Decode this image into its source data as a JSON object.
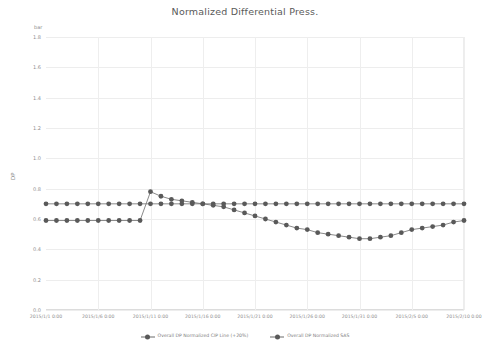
{
  "chart_data": {
    "type": "line",
    "title": "Normalized Differential Press.",
    "unit_label": "bar",
    "ylabel": "DP",
    "xlabel": "",
    "ylim": [
      0.0,
      1.8
    ],
    "ytick_labels": [
      "1.8",
      "1.6",
      "1.4",
      "1.2",
      "1.0",
      "0.8",
      "0.6",
      "0.4",
      "0.2",
      "0.0"
    ],
    "ytick_values": [
      1.8,
      1.6,
      1.4,
      1.2,
      1.0,
      0.8,
      0.6,
      0.4,
      0.2,
      0.0
    ],
    "grid": true,
    "legend_position": "bottom",
    "x": [
      "2015/1/1 0:00",
      "2015/1/2 0:00",
      "2015/1/3 0:00",
      "2015/1/4 0:00",
      "2015/1/5 0:00",
      "2015/1/6 0:00",
      "2015/1/7 0:00",
      "2015/1/8 0:00",
      "2015/1/9 0:00",
      "2015/1/10 0:00",
      "2015/1/11 0:00",
      "2015/1/12 0:00",
      "2015/1/13 0:00",
      "2015/1/14 0:00",
      "2015/1/15 0:00",
      "2015/1/16 0:00",
      "2015/1/17 0:00",
      "2015/1/18 0:00",
      "2015/1/19 0:00",
      "2015/1/20 0:00",
      "2015/1/21 0:00",
      "2015/1/22 0:00",
      "2015/1/23 0:00",
      "2015/1/24 0:00",
      "2015/1/25 0:00",
      "2015/1/26 0:00",
      "2015/1/27 0:00",
      "2015/1/28 0:00",
      "2015/1/29 0:00",
      "2015/1/30 0:00",
      "2015/1/31 0:00",
      "2015/2/1 0:00",
      "2015/2/2 0:00",
      "2015/2/3 0:00",
      "2015/2/4 0:00",
      "2015/2/5 0:00",
      "2015/2/6 0:00",
      "2015/2/7 0:00",
      "2015/2/8 0:00",
      "2015/2/9 0:00",
      "2015/2/10 0:00"
    ],
    "xtick_labels": [
      "2015/1/1 0:00",
      "2015/1/6 0:00",
      "2015/1/11 0:00",
      "2015/1/16 0:00",
      "2015/1/21 0:00",
      "2015/1/26 0:00",
      "2015/1/31 0:00",
      "2015/2/5 0:00",
      "2015/2/10 0:00"
    ],
    "xtick_indices": [
      0,
      5,
      10,
      15,
      20,
      25,
      30,
      35,
      40
    ],
    "marker_color": "#595959",
    "line_color": "#6b6b6b",
    "series": [
      {
        "name": "Overall DP Normalized CIP Line (+20%)",
        "values": [
          0.7,
          0.7,
          0.7,
          0.7,
          0.7,
          0.7,
          0.7,
          0.7,
          0.7,
          0.7,
          0.7,
          0.7,
          0.7,
          0.7,
          0.7,
          0.7,
          0.7,
          0.7,
          0.7,
          0.7,
          0.7,
          0.7,
          0.7,
          0.7,
          0.7,
          0.7,
          0.7,
          0.7,
          0.7,
          0.7,
          0.7,
          0.7,
          0.7,
          0.7,
          0.7,
          0.7,
          0.7,
          0.7,
          0.7,
          0.7,
          0.7
        ]
      },
      {
        "name": "Overall DP Normalized SAS",
        "values": [
          0.59,
          0.59,
          0.59,
          0.59,
          0.59,
          0.59,
          0.59,
          0.59,
          0.59,
          0.59,
          0.78,
          0.75,
          0.73,
          0.72,
          0.71,
          0.7,
          0.69,
          0.68,
          0.66,
          0.64,
          0.62,
          0.6,
          0.58,
          0.56,
          0.54,
          0.53,
          0.51,
          0.5,
          0.49,
          0.48,
          0.47,
          0.47,
          0.48,
          0.49,
          0.51,
          0.53,
          0.54,
          0.55,
          0.56,
          0.58,
          0.59
        ]
      }
    ]
  },
  "legend": {
    "items": [
      {
        "label": "Overall DP Normalized CIP Line (+20%)"
      },
      {
        "label": "Overall DP Normalized SAS"
      }
    ]
  }
}
